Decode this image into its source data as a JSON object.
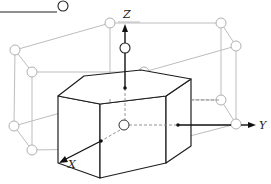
{
  "diagram": {
    "type": "hexagonal-crystal-lattice",
    "axes": {
      "x_label": "X",
      "y_label": "Y",
      "z_label": "Z"
    },
    "colors": {
      "solid": "#1e1e1e",
      "lattice": "#b8b8b8",
      "background": "#ffffff"
    }
  }
}
